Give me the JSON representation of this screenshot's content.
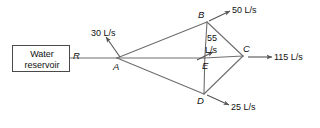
{
  "diagram": {
    "reservoir": {
      "line1": "Water",
      "line2": "reservoir"
    },
    "nodes": {
      "r": "R",
      "a": "A",
      "b": "B",
      "c": "C",
      "d": "D",
      "e": "E"
    },
    "flows": {
      "a_out": "30 L/s",
      "b_out": "50 L/s",
      "e_out_line1": "55",
      "e_out_line2": "L/s",
      "c_out": "115 L/s",
      "d_out": "25 L/s"
    },
    "colors": {
      "line": "#6e6e6e",
      "box_border": "#4a4a4a",
      "text": "#111111",
      "background": "#ffffff"
    }
  }
}
